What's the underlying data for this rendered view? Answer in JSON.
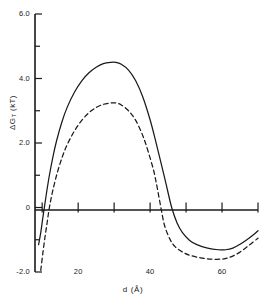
{
  "chart_data": {
    "type": "line",
    "title": "",
    "subtitle": "",
    "xlabel": "d  (Å)",
    "ylabel_main": "ΔG",
    "ylabel_sub": "T",
    "ylabel_units": "  (kT)",
    "ylabel": "ΔG_T  (kT)",
    "xlim": [
      8,
      70
    ],
    "ylim": [
      -2.0,
      6.0
    ],
    "grid": false,
    "legend": "none",
    "x_major_ticks": [
      20,
      40,
      60
    ],
    "x_major_tick_labels": [
      "20",
      "40",
      "60"
    ],
    "x_minor_ticks": [
      10,
      30,
      50,
      70
    ],
    "y_major_ticks": [
      -2.0,
      0,
      2.0,
      4.0,
      6.0
    ],
    "y_major_tick_labels": [
      "-2.0",
      "0",
      "2.0",
      "4.0",
      "6.0"
    ],
    "y_minor_ticks": [
      -1.0,
      1.0,
      3.0,
      5.0
    ],
    "zero_line": 0,
    "series": [
      {
        "name": "solid",
        "style": "solid",
        "color": "#1a1a1a",
        "points": [
          [
            9.0,
            -1.15
          ],
          [
            9.6,
            -0.78
          ],
          [
            10.2,
            -0.3
          ],
          [
            10.6,
            0.0
          ],
          [
            11.2,
            0.45
          ],
          [
            12.0,
            1.0
          ],
          [
            13.0,
            1.58
          ],
          [
            14.0,
            2.07
          ],
          [
            15.5,
            2.66
          ],
          [
            17.0,
            3.12
          ],
          [
            19.0,
            3.58
          ],
          [
            21.0,
            3.93
          ],
          [
            23.0,
            4.18
          ],
          [
            25.0,
            4.35
          ],
          [
            27.0,
            4.46
          ],
          [
            29.0,
            4.5
          ],
          [
            30.5,
            4.5
          ],
          [
            32.0,
            4.44
          ],
          [
            34.0,
            4.26
          ],
          [
            36.0,
            3.93
          ],
          [
            38.0,
            3.42
          ],
          [
            40.0,
            2.72
          ],
          [
            41.5,
            2.08
          ],
          [
            43.0,
            1.4
          ],
          [
            44.5,
            0.7
          ],
          [
            46.0,
            0.0
          ],
          [
            47.5,
            -0.48
          ],
          [
            49.0,
            -0.78
          ],
          [
            51.0,
            -1.02
          ],
          [
            53.0,
            -1.15
          ],
          [
            56.0,
            -1.26
          ],
          [
            59.0,
            -1.31
          ],
          [
            61.0,
            -1.31
          ],
          [
            63.0,
            -1.26
          ],
          [
            65.0,
            -1.14
          ],
          [
            67.0,
            -0.99
          ],
          [
            69.0,
            -0.82
          ],
          [
            70.0,
            -0.72
          ]
        ]
      },
      {
        "name": "dashed",
        "style": "dashed",
        "color": "#1a1a1a",
        "points": [
          [
            9.6,
            -1.95
          ],
          [
            10.2,
            -1.4
          ],
          [
            10.8,
            -0.9
          ],
          [
            11.4,
            -0.45
          ],
          [
            12.0,
            0.0
          ],
          [
            12.8,
            0.45
          ],
          [
            14.0,
            1.0
          ],
          [
            15.5,
            1.54
          ],
          [
            17.0,
            1.96
          ],
          [
            19.0,
            2.38
          ],
          [
            21.0,
            2.7
          ],
          [
            23.0,
            2.94
          ],
          [
            25.0,
            3.1
          ],
          [
            27.0,
            3.2
          ],
          [
            29.0,
            3.24
          ],
          [
            30.5,
            3.24
          ],
          [
            32.0,
            3.18
          ],
          [
            34.0,
            3.0
          ],
          [
            36.0,
            2.7
          ],
          [
            38.0,
            2.22
          ],
          [
            39.5,
            1.72
          ],
          [
            41.0,
            1.14
          ],
          [
            42.0,
            0.6
          ],
          [
            43.0,
            0.0
          ],
          [
            44.0,
            -0.55
          ],
          [
            45.5,
            -0.98
          ],
          [
            47.0,
            -1.22
          ],
          [
            49.0,
            -1.38
          ],
          [
            51.0,
            -1.48
          ],
          [
            54.0,
            -1.56
          ],
          [
            57.0,
            -1.6
          ],
          [
            60.0,
            -1.6
          ],
          [
            62.0,
            -1.55
          ],
          [
            64.0,
            -1.45
          ],
          [
            66.0,
            -1.3
          ],
          [
            68.0,
            -1.13
          ],
          [
            70.0,
            -0.95
          ]
        ]
      }
    ]
  }
}
